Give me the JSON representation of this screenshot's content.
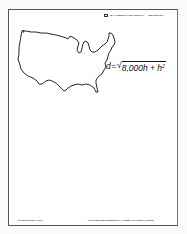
{
  "header": {
    "publisher": "W. H. FREEMAN AND COMPANY",
    "city": "San Francisco"
  },
  "figure": {
    "map_label": "united-states-outline",
    "formula": {
      "lhs": "d",
      "equals": "=",
      "radicand": "8,000h + h",
      "exponent": "2"
    }
  },
  "footer": {
    "left": "TRANSPARENCY 13-12",
    "right": "To be used with ELEMENTARY ALGEBRA by Harold R. Jacobs"
  }
}
